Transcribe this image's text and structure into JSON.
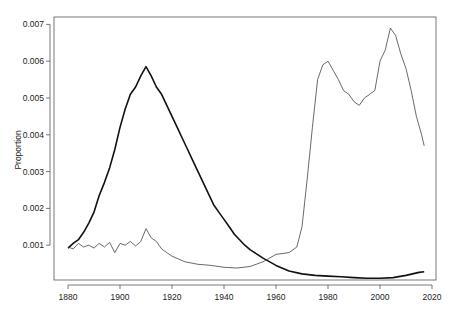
{
  "chart_data": {
    "type": "line",
    "title": "",
    "xlabel": "",
    "ylabel": "Proportion",
    "xlim": [
      1880,
      2017
    ],
    "ylim": [
      0,
      0.0071
    ],
    "x_ticks": [
      1880,
      1900,
      1920,
      1940,
      1960,
      1980,
      2000,
      2020
    ],
    "y_ticks": [
      "0.001",
      "0.002",
      "0.003",
      "0.004",
      "0.005",
      "0.006",
      "0.007"
    ],
    "y_tick_values": [
      0.001,
      0.002,
      0.003,
      0.004,
      0.005,
      0.006,
      0.007
    ],
    "grid": false,
    "legend": null,
    "series": [
      {
        "name": "thick-series",
        "style": "thick",
        "x": [
          1880,
          1882,
          1884,
          1886,
          1888,
          1890,
          1892,
          1894,
          1896,
          1898,
          1900,
          1902,
          1904,
          1906,
          1908,
          1910,
          1912,
          1914,
          1916,
          1918,
          1920,
          1922,
          1924,
          1926,
          1928,
          1930,
          1932,
          1934,
          1936,
          1938,
          1940,
          1942,
          1944,
          1946,
          1948,
          1950,
          1955,
          1960,
          1965,
          1970,
          1975,
          1980,
          1985,
          1990,
          1995,
          2000,
          2005,
          2010,
          2015,
          2017
        ],
        "values": [
          0.00092,
          0.00105,
          0.00115,
          0.00135,
          0.0016,
          0.0019,
          0.00235,
          0.0027,
          0.0031,
          0.0036,
          0.0042,
          0.0047,
          0.0051,
          0.0053,
          0.0056,
          0.00585,
          0.0056,
          0.0053,
          0.0051,
          0.0048,
          0.0045,
          0.0042,
          0.0039,
          0.0036,
          0.0033,
          0.003,
          0.0027,
          0.0024,
          0.0021,
          0.0019,
          0.0017,
          0.0015,
          0.0013,
          0.00115,
          0.001,
          0.00088,
          0.00065,
          0.00045,
          0.0003,
          0.00022,
          0.00018,
          0.00016,
          0.00014,
          0.00012,
          0.0001,
          0.0001,
          0.00012,
          0.00018,
          0.00026,
          0.00028
        ]
      },
      {
        "name": "thin-series",
        "style": "thin",
        "x": [
          1880,
          1882,
          1884,
          1886,
          1888,
          1890,
          1892,
          1894,
          1896,
          1898,
          1900,
          1902,
          1904,
          1906,
          1908,
          1910,
          1912,
          1914,
          1916,
          1918,
          1920,
          1925,
          1930,
          1935,
          1940,
          1945,
          1950,
          1955,
          1960,
          1965,
          1968,
          1970,
          1972,
          1974,
          1976,
          1978,
          1980,
          1982,
          1984,
          1986,
          1988,
          1990,
          1992,
          1994,
          1996,
          1998,
          2000,
          2002,
          2004,
          2006,
          2008,
          2010,
          2012,
          2014,
          2016,
          2017
        ],
        "values": [
          0.00095,
          0.0009,
          0.00105,
          0.00095,
          0.001,
          0.00092,
          0.00105,
          0.00095,
          0.00108,
          0.0008,
          0.00105,
          0.001,
          0.0011,
          0.00098,
          0.0011,
          0.00145,
          0.0012,
          0.0011,
          0.0009,
          0.0008,
          0.0007,
          0.00055,
          0.00048,
          0.00045,
          0.0004,
          0.00038,
          0.00042,
          0.00055,
          0.00075,
          0.0008,
          0.00095,
          0.0015,
          0.0028,
          0.0042,
          0.0055,
          0.0059,
          0.006,
          0.00575,
          0.0055,
          0.0052,
          0.0051,
          0.0049,
          0.0048,
          0.005,
          0.0051,
          0.0052,
          0.006,
          0.0063,
          0.0069,
          0.0067,
          0.0062,
          0.0058,
          0.0052,
          0.0045,
          0.004,
          0.0037
        ]
      }
    ]
  }
}
